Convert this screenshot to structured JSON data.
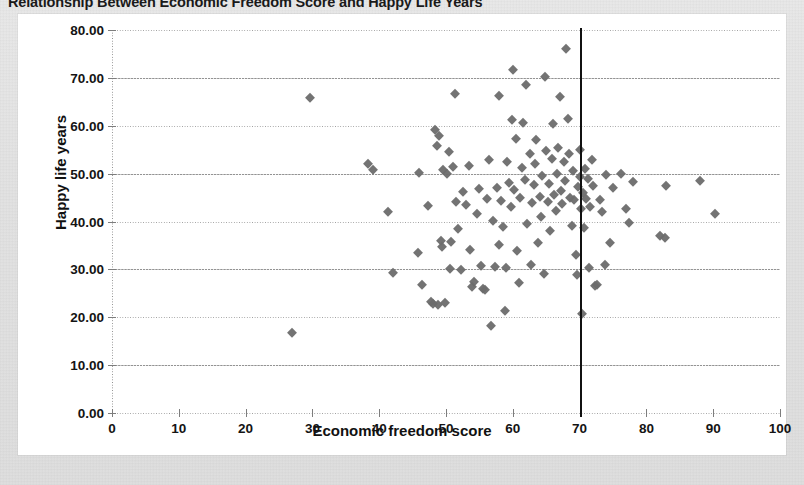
{
  "chart_data": {
    "type": "scatter",
    "title": "Relationship Between Economic Freedom Score and Happy Life Years",
    "xlabel": "Economic freedom score",
    "ylabel": "Happy life years",
    "xlim": [
      0,
      100
    ],
    "ylim": [
      0,
      80
    ],
    "xticks": [
      "0",
      "10",
      "20",
      "30",
      "40",
      "50",
      "60",
      "70",
      "80",
      "90",
      "100"
    ],
    "xtick_values": [
      0,
      10,
      20,
      30,
      40,
      50,
      60,
      70,
      80,
      90,
      100
    ],
    "yticks": [
      "0.00",
      "10.00",
      "20.00",
      "30.00",
      "40.00",
      "50.00",
      "60.00",
      "70.00",
      "80.00"
    ],
    "ytick_values": [
      0,
      10,
      20,
      30,
      40,
      50,
      60,
      70,
      80
    ],
    "grid": "horizontal-dotted",
    "legend": null,
    "marker_shape": "diamond",
    "marker_color": "#6b6b6b",
    "annotations": [
      {
        "type": "vertical-line",
        "name": "reference-line-70",
        "x": 70,
        "color": "#111111",
        "label": ""
      }
    ],
    "points": [
      [
        27.0,
        16.8
      ],
      [
        29.6,
        65.9
      ],
      [
        38.3,
        52.1
      ],
      [
        39.1,
        50.8
      ],
      [
        41.3,
        41.9
      ],
      [
        42.0,
        29.3
      ],
      [
        45.8,
        33.5
      ],
      [
        46.0,
        50.2
      ],
      [
        46.4,
        26.7
      ],
      [
        47.3,
        43.3
      ],
      [
        47.8,
        23.2
      ],
      [
        48.0,
        22.8
      ],
      [
        48.4,
        59.2
      ],
      [
        48.6,
        55.7
      ],
      [
        48.8,
        22.6
      ],
      [
        49.0,
        57.8
      ],
      [
        49.2,
        36.0
      ],
      [
        49.4,
        34.6
      ],
      [
        49.6,
        50.7
      ],
      [
        49.9,
        23.0
      ],
      [
        50.1,
        49.9
      ],
      [
        50.4,
        54.5
      ],
      [
        50.6,
        30.1
      ],
      [
        50.8,
        35.7
      ],
      [
        51.0,
        51.3
      ],
      [
        51.3,
        66.6
      ],
      [
        51.5,
        44.1
      ],
      [
        51.8,
        38.4
      ],
      [
        52.2,
        29.8
      ],
      [
        52.6,
        46.1
      ],
      [
        53.0,
        43.5
      ],
      [
        53.4,
        51.6
      ],
      [
        53.6,
        34.1
      ],
      [
        53.9,
        26.3
      ],
      [
        54.2,
        27.4
      ],
      [
        54.6,
        41.6
      ],
      [
        55.0,
        46.8
      ],
      [
        55.3,
        30.8
      ],
      [
        55.6,
        26.0
      ],
      [
        55.9,
        25.7
      ],
      [
        56.2,
        44.7
      ],
      [
        56.5,
        52.8
      ],
      [
        56.8,
        18.1
      ],
      [
        57.0,
        40.2
      ],
      [
        57.3,
        30.6
      ],
      [
        57.6,
        47.1
      ],
      [
        57.9,
        35.0
      ],
      [
        58.0,
        66.3
      ],
      [
        58.2,
        44.3
      ],
      [
        58.5,
        38.9
      ],
      [
        58.8,
        21.4
      ],
      [
        59.0,
        30.3
      ],
      [
        59.2,
        52.4
      ],
      [
        59.4,
        48.0
      ],
      [
        59.7,
        43.0
      ],
      [
        59.9,
        61.2
      ],
      [
        60.0,
        71.6
      ],
      [
        60.2,
        46.5
      ],
      [
        60.5,
        57.3
      ],
      [
        60.7,
        33.9
      ],
      [
        60.9,
        27.1
      ],
      [
        61.1,
        44.9
      ],
      [
        61.4,
        51.1
      ],
      [
        61.6,
        60.6
      ],
      [
        61.8,
        48.6
      ],
      [
        62.0,
        68.6
      ],
      [
        62.2,
        39.4
      ],
      [
        62.5,
        54.0
      ],
      [
        62.7,
        30.9
      ],
      [
        62.9,
        43.8
      ],
      [
        63.1,
        47.6
      ],
      [
        63.3,
        52.0
      ],
      [
        63.5,
        57.0
      ],
      [
        63.8,
        35.6
      ],
      [
        64.0,
        45.2
      ],
      [
        64.2,
        41.0
      ],
      [
        64.4,
        49.4
      ],
      [
        64.6,
        29.0
      ],
      [
        64.8,
        70.2
      ],
      [
        65.0,
        54.8
      ],
      [
        65.2,
        44.0
      ],
      [
        65.4,
        47.9
      ],
      [
        65.6,
        38.1
      ],
      [
        65.8,
        53.1
      ],
      [
        66.0,
        60.3
      ],
      [
        66.2,
        45.6
      ],
      [
        66.4,
        42.2
      ],
      [
        66.6,
        50.0
      ],
      [
        66.8,
        55.4
      ],
      [
        67.0,
        66.0
      ],
      [
        67.2,
        46.3
      ],
      [
        67.4,
        43.6
      ],
      [
        67.6,
        52.5
      ],
      [
        67.8,
        48.4
      ],
      [
        68.0,
        76.0
      ],
      [
        68.2,
        61.5
      ],
      [
        68.4,
        54.2
      ],
      [
        68.6,
        45.0
      ],
      [
        68.8,
        39.0
      ],
      [
        69.0,
        50.5
      ],
      [
        69.2,
        44.4
      ],
      [
        69.4,
        33.0
      ],
      [
        69.6,
        28.9
      ],
      [
        69.8,
        47.2
      ],
      [
        70.0,
        54.9
      ],
      [
        70.1,
        49.2
      ],
      [
        70.2,
        42.7
      ],
      [
        70.3,
        20.7
      ],
      [
        70.5,
        46.0
      ],
      [
        70.6,
        38.6
      ],
      [
        70.8,
        51.0
      ],
      [
        71.0,
        44.8
      ],
      [
        71.2,
        48.9
      ],
      [
        71.4,
        30.2
      ],
      [
        71.6,
        43.1
      ],
      [
        71.8,
        52.9
      ],
      [
        72.0,
        47.5
      ],
      [
        72.3,
        26.5
      ],
      [
        72.6,
        26.8
      ],
      [
        73.0,
        44.5
      ],
      [
        73.4,
        42.0
      ],
      [
        73.8,
        31.0
      ],
      [
        74.0,
        49.8
      ],
      [
        74.6,
        35.5
      ],
      [
        75.0,
        47.0
      ],
      [
        76.2,
        49.9
      ],
      [
        77.0,
        42.6
      ],
      [
        77.4,
        39.6
      ],
      [
        78.0,
        48.3
      ],
      [
        82.0,
        36.9
      ],
      [
        82.8,
        36.6
      ],
      [
        83.0,
        47.4
      ],
      [
        88.0,
        48.5
      ],
      [
        90.2,
        41.6
      ]
    ]
  }
}
